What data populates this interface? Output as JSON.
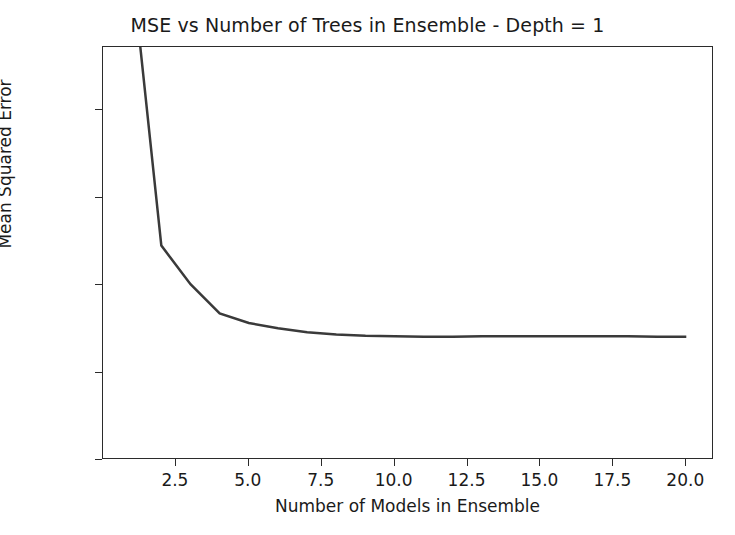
{
  "chart_data": {
    "type": "line",
    "title": "MSE vs Number of Trees in Ensemble - Depth = 1",
    "xlabel": "Number of Models in Ensemble",
    "ylabel": "Mean Squared Error",
    "x": [
      1,
      2,
      3,
      4,
      5,
      6,
      7,
      8,
      9,
      10,
      11,
      12,
      13,
      14,
      15,
      16,
      17,
      18,
      19,
      20
    ],
    "values": [
      0.112,
      0.049,
      0.0402,
      0.0335,
      0.0313,
      0.0301,
      0.0292,
      0.0287,
      0.0284,
      0.0283,
      0.0282,
      0.0282,
      0.0283,
      0.0283,
      0.0283,
      0.0283,
      0.0283,
      0.0283,
      0.0282,
      0.0282
    ],
    "series": [
      {
        "name": "MSE",
        "color": "#3a3a3a",
        "values": [
          0.112,
          0.049,
          0.0402,
          0.0335,
          0.0313,
          0.0301,
          0.0292,
          0.0287,
          0.0284,
          0.0283,
          0.0282,
          0.0282,
          0.0283,
          0.0283,
          0.0283,
          0.0283,
          0.0283,
          0.0283,
          0.0282,
          0.0282
        ]
      }
    ],
    "xlim": [
      0.0,
      20.95
    ],
    "ylim": [
      0.0,
      0.0944
    ],
    "xticks": [
      2.5,
      5.0,
      7.5,
      10.0,
      12.5,
      15.0,
      17.5,
      20.0
    ],
    "xtick_labels": [
      "2.5",
      "5.0",
      "7.5",
      "10.0",
      "12.5",
      "15.0",
      "17.5",
      "20.0"
    ],
    "yticks": [
      0.0,
      0.02,
      0.04,
      0.06,
      0.08
    ],
    "ytick_labels": [
      "0.00",
      "0.02",
      "0.04",
      "0.06",
      "0.08"
    ],
    "grid": false,
    "legend": null,
    "line_color": "#3a3a3a",
    "background": "#ffffff",
    "note": "Curve for n=1 is clipped by the top of the axes (value exceeds y-axis upper limit)."
  }
}
